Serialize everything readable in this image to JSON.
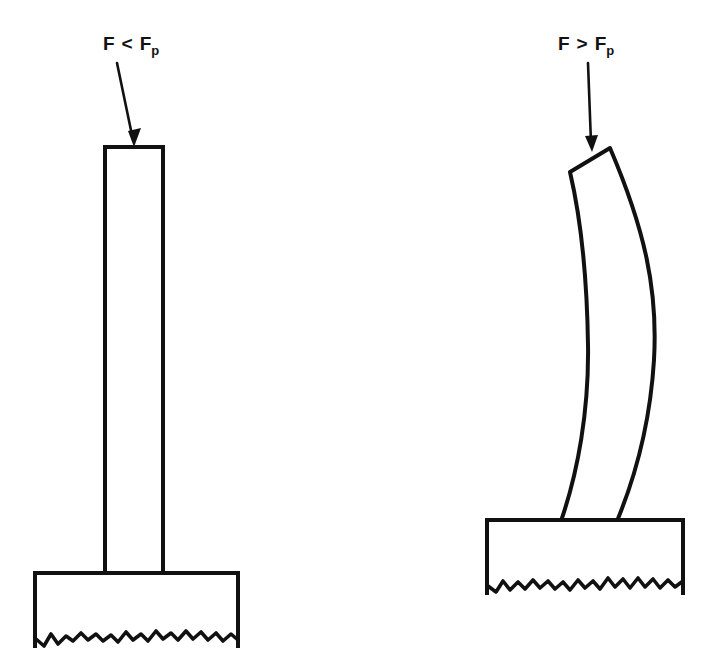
{
  "figure": {
    "background_color": "#ffffff",
    "line_color": "#111111",
    "title": "",
    "panels": [
      {
        "id": "left",
        "name": "unbuckled-column",
        "label": {
          "base": "F",
          "relation": "<",
          "force": "F",
          "subscript": "p",
          "full_text": "F < Fp",
          "x": 103,
          "y": 50
        },
        "load_arrow": {
          "from_x": 118,
          "from_y": 63,
          "to_x": 134,
          "to_y": 145,
          "direction": "down-right",
          "head": "solid"
        },
        "column": {
          "shape": "straight",
          "left_x": 105,
          "right_x": 163,
          "top_y": 147,
          "bottom_y": 574,
          "width": 58,
          "height": 427
        },
        "foundation": {
          "left_x": 35,
          "right_x": 238,
          "top_y": 573,
          "bottom_y": 648,
          "width": 203,
          "height": 75,
          "bottom_edge": "jagged-break-line"
        }
      },
      {
        "id": "right",
        "name": "buckled-column",
        "label": {
          "base": "F",
          "relation": ">",
          "force": "F",
          "subscript": "p",
          "full_text": "F > Fp",
          "x": 558,
          "y": 50
        },
        "load_arrow": {
          "from_x": 589,
          "from_y": 63,
          "to_x": 592,
          "to_y": 150,
          "direction": "down",
          "head": "solid"
        },
        "column": {
          "shape": "buckled-curve",
          "top_cap_left_x": 570,
          "top_cap_left_y": 172,
          "top_cap_right_x": 610,
          "top_cap_right_y": 148,
          "base_left_x": 561,
          "base_right_x": 617,
          "base_y": 521,
          "max_bulge_x": 655,
          "max_bulge_y": 310,
          "bow_direction": "right"
        },
        "foundation": {
          "left_x": 487,
          "right_x": 683,
          "top_y": 520,
          "bottom_y": 595,
          "width": 196,
          "height": 75,
          "bottom_edge": "jagged-break-line"
        }
      }
    ]
  }
}
